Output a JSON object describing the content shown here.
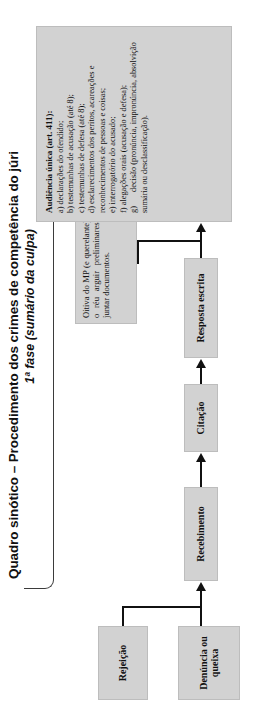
{
  "diagram": {
    "title_line1": "Quadro sinótico – Procedimento dos crimes de competência do júri",
    "title_line2": "1ª fase (sumário da culpa)",
    "nodes": {
      "denuncia": "Denúncia ou queixa",
      "rejeicao": "Rejeição",
      "recebimento": "Recebimento",
      "citacao": "Citação",
      "resposta": "Resposta escrita",
      "oitiva": "Oitiva do MP (e querelante), se o réu arguir preliminares ou juntar documentos."
    },
    "audiencia": {
      "heading": "Audiência única (art. 411):",
      "items": [
        "a) declarações do ofendido;",
        "b) testemunhas de acusação (até 8);",
        "c) testemunhas de defesa (até 8);",
        "d) esclarecimentos dos peritos, acareações e reconhecimentos de pessoas e coisas;",
        "e) interrogatório do acusado;",
        "f) alegações orais (acusação e defesa);"
      ],
      "item_g_label": "g)",
      "item_g_text": "decisão (pronúncia, impronúncia, absolvição sumária ou desclassificação)."
    },
    "colors": {
      "box_fill": "#d2d2d2",
      "box_border": "#bdbdbd",
      "line": "#111111",
      "text": "#111111",
      "page_background": "#ffffff"
    }
  }
}
